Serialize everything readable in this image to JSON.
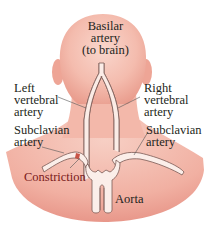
{
  "diagram": {
    "colors": {
      "skin": "#f2b3a6",
      "skin_light": "#f9d4ca",
      "skin_edge": "#e8998a",
      "artery_fill": "#fbeee9",
      "artery_stroke": "#7a5a55",
      "constriction": "#c0392b",
      "text": "#231f20",
      "constriction_text": "#6b1a1a"
    },
    "labels": {
      "basilar": "Basilar\nartery\n(to brain)",
      "left_vertebral": "Left\nvertebral\nartery",
      "right_vertebral": "Right\nvertebral\nartery",
      "left_subclavian": "Subclavian\nartery",
      "right_subclavian": "Subclavian\nartery",
      "constriction": "Constriction",
      "aorta": "Aorta"
    }
  }
}
